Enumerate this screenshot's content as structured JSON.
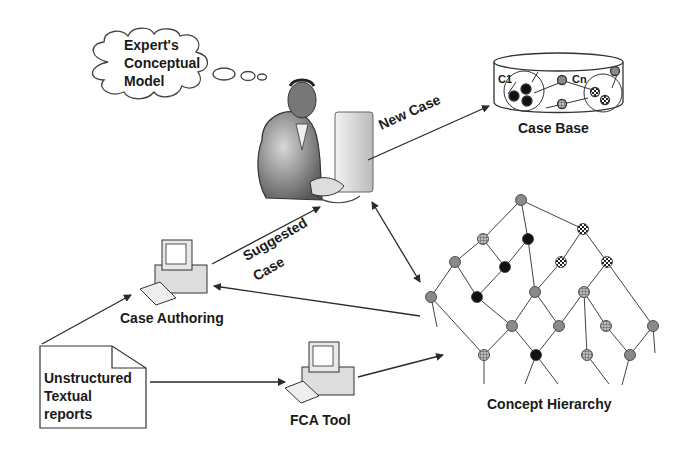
{
  "diagram": {
    "thought_bubble": {
      "lines": [
        "Expert's",
        "Conceptual",
        "Model"
      ]
    },
    "case_base": {
      "label": "Case Base",
      "cluster_first": "C1",
      "cluster_last": "Cn"
    },
    "arrows": {
      "new_case": "New Case",
      "suggested_case_line1": "Suggested",
      "suggested_case_line2": "Case"
    },
    "case_authoring": {
      "label": "Case Authoring"
    },
    "fca_tool": {
      "label": "FCA Tool"
    },
    "reports": {
      "lines": [
        "Unstructured",
        "Textual",
        "reports"
      ]
    },
    "concept_hierarchy": {
      "label": "Concept Hierarchy"
    },
    "node_styles": {
      "gray": "#8a8a8a",
      "black": "#111111",
      "grid": "hatched",
      "dotted": "checkered"
    },
    "colors": {
      "ink": "#2a2a2a",
      "text": "#1a1a1a",
      "background": "#ffffff"
    }
  }
}
